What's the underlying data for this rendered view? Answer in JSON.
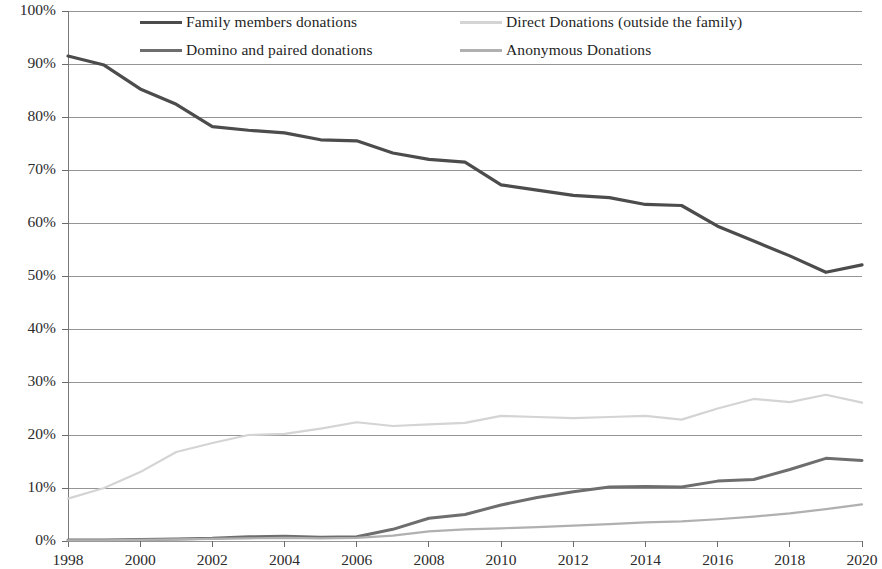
{
  "chart_data": {
    "type": "line",
    "title": "",
    "subtitle": "",
    "xlabel": "",
    "ylabel": "",
    "xlim": [
      1998,
      2020
    ],
    "ylim": [
      0,
      100
    ],
    "grid": true,
    "legend_position": "top",
    "y_ticks": [
      "0%",
      "10%",
      "20%",
      "30%",
      "40%",
      "50%",
      "60%",
      "70%",
      "80%",
      "90%",
      "100%"
    ],
    "y_tick_values": [
      0,
      10,
      20,
      30,
      40,
      50,
      60,
      70,
      80,
      90,
      100
    ],
    "x_ticks": [
      "1998",
      "2000",
      "2002",
      "2004",
      "2006",
      "2008",
      "2010",
      "2012",
      "2014",
      "2016",
      "2018",
      "2020"
    ],
    "x_tick_values": [
      1998,
      2000,
      2002,
      2004,
      2006,
      2008,
      2010,
      2012,
      2014,
      2016,
      2018,
      2020
    ],
    "x": [
      1998,
      1999,
      2000,
      2001,
      2002,
      2003,
      2004,
      2005,
      2006,
      2007,
      2008,
      2009,
      2010,
      2011,
      2012,
      2013,
      2014,
      2015,
      2016,
      2017,
      2018,
      2019,
      2020
    ],
    "series": [
      {
        "name": "Family members donations",
        "color": "#4c4c4c",
        "style": "solid",
        "width": 3.2,
        "values": [
          91.5,
          89.8,
          85.3,
          82.4,
          78.2,
          77.5,
          77.0,
          75.7,
          75.5,
          73.2,
          72.0,
          71.5,
          67.2,
          66.2,
          65.2,
          64.8,
          63.5,
          63.3,
          59.4,
          56.6,
          53.8,
          50.7,
          52.1
        ]
      },
      {
        "name": "Direct Donations (outside the family)",
        "color": "#d4d4d4",
        "style": "solid",
        "width": 2.2,
        "values": [
          8.0,
          10.0,
          13.0,
          16.8,
          18.5,
          20.0,
          20.2,
          21.2,
          22.4,
          21.7,
          22.0,
          22.3,
          23.6,
          23.4,
          23.2,
          23.4,
          23.6,
          22.9,
          25.0,
          26.8,
          26.2,
          27.6,
          26.1
        ]
      },
      {
        "name": "Domino and paired donations",
        "color": "#6e6e6e",
        "style": "solid",
        "width": 3.0,
        "values": [
          0.2,
          0.2,
          0.3,
          0.4,
          0.5,
          0.8,
          0.9,
          0.7,
          0.8,
          2.2,
          4.3,
          5.0,
          6.8,
          8.2,
          9.3,
          10.2,
          10.3,
          10.2,
          11.3,
          11.6,
          13.5,
          15.6,
          15.2
        ]
      },
      {
        "name": "Anonymous Donations",
        "color": "#b0b0b0",
        "style": "solid",
        "width": 2.2,
        "values": [
          0.1,
          0.1,
          0.2,
          0.3,
          0.4,
          0.5,
          0.6,
          0.5,
          0.6,
          1.0,
          1.8,
          2.2,
          2.4,
          2.6,
          2.9,
          3.2,
          3.5,
          3.7,
          4.1,
          4.6,
          5.2,
          6.0,
          6.9
        ]
      }
    ]
  },
  "legend": {
    "entries": [
      {
        "label": "Family members donations",
        "series_index": 0
      },
      {
        "label": "Direct Donations (outside the family)",
        "series_index": 1
      },
      {
        "label": "Domino and paired donations",
        "series_index": 2
      },
      {
        "label": "Anonymous Donations",
        "series_index": 3
      }
    ]
  },
  "colors": {
    "gridline": "#8a8a8a",
    "axis": "#6b6b6b",
    "text": "#2b2b2b",
    "background": "#ffffff"
  }
}
